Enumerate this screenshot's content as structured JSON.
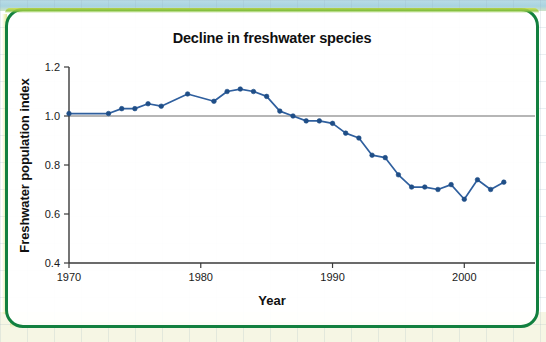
{
  "figure": {
    "title": "Decline in freshwater species",
    "x_axis_label": "Year",
    "y_axis_label": "Freshwater population index"
  },
  "colors": {
    "series": "#2f5f9e",
    "marker": "#1f4e87",
    "axis": "#3a3a3a",
    "reference_line": "#6e6e6e",
    "card_border": "#12803f",
    "highlight": "#cfdc4a"
  },
  "chart_data": {
    "type": "line",
    "title": "Decline in freshwater species",
    "xlabel": "Year",
    "ylabel": "Freshwater population index",
    "xlim": [
      1970,
      2004
    ],
    "ylim": [
      0.4,
      1.2
    ],
    "xticks": [
      1970,
      1980,
      1990,
      2000
    ],
    "xtick_labels": [
      "1970",
      "1980",
      "1990",
      "2000"
    ],
    "yticks": [
      0.4,
      0.6,
      0.8,
      1.0,
      1.2
    ],
    "ytick_labels": [
      "0.4",
      "0.6",
      "0.8",
      "1.0",
      "1.2"
    ],
    "grid": false,
    "legend": null,
    "reference_line_y": 1.0,
    "markers": true,
    "series": [
      {
        "name": "Freshwater population index",
        "color": "#2f5f9e",
        "x": [
          1970,
          1973,
          1974,
          1975,
          1976,
          1977,
          1979,
          1981,
          1982,
          1983,
          1984,
          1985,
          1986,
          1987,
          1988,
          1989,
          1990,
          1991,
          1992,
          1993,
          1994,
          1995,
          1996,
          1997,
          1998,
          1999,
          2000,
          2001,
          2002,
          2003
        ],
        "values": [
          1.01,
          1.01,
          1.03,
          1.03,
          1.05,
          1.04,
          1.09,
          1.06,
          1.1,
          1.11,
          1.1,
          1.08,
          1.02,
          1.0,
          0.98,
          0.98,
          0.97,
          0.93,
          0.91,
          0.84,
          0.83,
          0.76,
          0.71,
          0.71,
          0.7,
          0.72,
          0.66,
          0.74,
          0.7,
          0.73
        ]
      }
    ]
  }
}
